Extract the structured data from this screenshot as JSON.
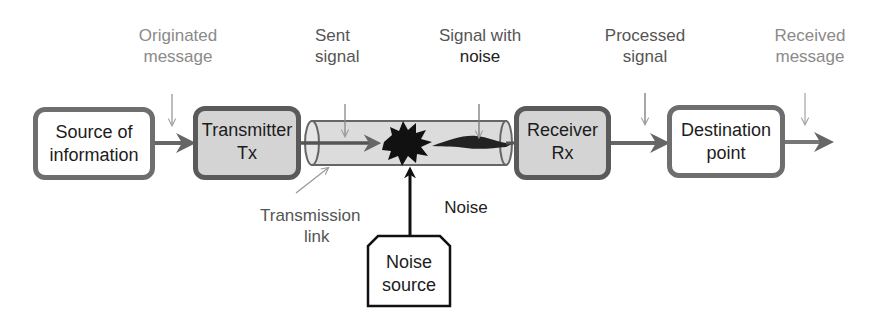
{
  "labels": {
    "originated_message": [
      "Originated",
      "message"
    ],
    "sent_signal": [
      "Sent",
      "signal"
    ],
    "signal_with_noise": [
      "Signal with",
      "noise"
    ],
    "processed_signal": [
      "Processed",
      "signal"
    ],
    "received_message": [
      "Received",
      "message"
    ],
    "transmission_link": [
      "Transmission",
      "link"
    ],
    "noise": "Noise"
  },
  "blocks": {
    "source": [
      "Source of",
      "information"
    ],
    "transmitter": [
      "Transmitter",
      "Tx"
    ],
    "receiver": [
      "Receiver",
      "Rx"
    ],
    "destination": [
      "Destination",
      "point"
    ],
    "noise_source": [
      "Noise",
      "source"
    ]
  },
  "colors": {
    "box_border_white": "#6e6e6e",
    "box_border_shaded": "#5a5a5a",
    "shaded_fill": "#d4d4d4",
    "tube_fill": "#dcdcdc",
    "arrow": "#666666",
    "label_gray": "#8a8a8a"
  }
}
